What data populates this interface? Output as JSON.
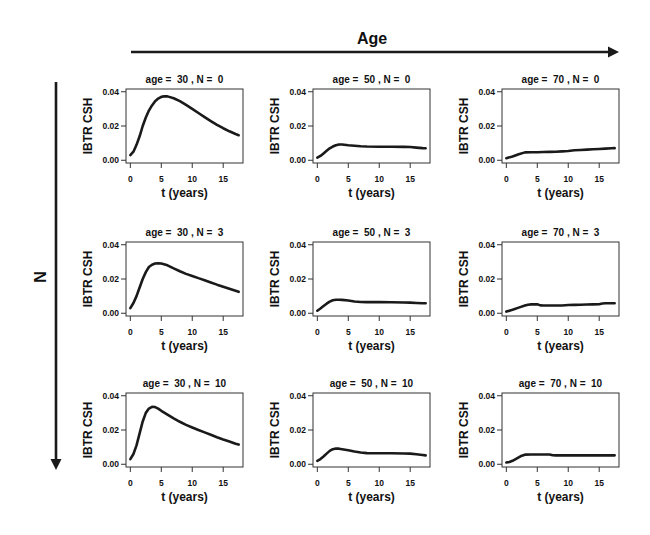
{
  "figure": {
    "column_axis_label": "Age",
    "row_axis_label": "N"
  },
  "chart_data": {
    "type": "line",
    "title": "",
    "grid_layout": {
      "rows": 3,
      "cols": 3
    },
    "column_variable": "age",
    "column_values": [
      30,
      50,
      70
    ],
    "row_variable": "N",
    "row_values": [
      0,
      3,
      10
    ],
    "xlabel": "t (years)",
    "ylabel": "IBTR CSH",
    "xlim": [
      0,
      17.5
    ],
    "ylim": [
      0,
      0.04
    ],
    "xticks": [
      0,
      5,
      10,
      15
    ],
    "xtick_labels": [
      "0",
      "5",
      "10",
      "15"
    ],
    "yticks": [
      0,
      0.02,
      0.04
    ],
    "ytick_labels": [
      "0.00",
      "0.02",
      "0.04"
    ],
    "grid": false,
    "legend": null,
    "panels": [
      {
        "title": "age =  30 , N =  0",
        "age": 30,
        "N": 0,
        "x": [
          0,
          0.5,
          1,
          1.5,
          2,
          2.5,
          3,
          3.5,
          4,
          4.5,
          5,
          5.5,
          6,
          7,
          8,
          9,
          10,
          11,
          12,
          13,
          14,
          15,
          16,
          17,
          17.5
        ],
        "y": [
          0.003,
          0.005,
          0.009,
          0.014,
          0.02,
          0.025,
          0.029,
          0.032,
          0.0345,
          0.036,
          0.037,
          0.0374,
          0.0373,
          0.0362,
          0.0345,
          0.0323,
          0.03,
          0.0276,
          0.0252,
          0.0229,
          0.0207,
          0.0187,
          0.0169,
          0.0153,
          0.0146
        ]
      },
      {
        "title": "age =  50 , N =  0",
        "age": 50,
        "N": 0,
        "x": [
          0,
          0.5,
          1,
          1.5,
          2,
          2.5,
          3,
          3.5,
          4,
          5,
          6,
          7,
          8,
          10,
          12,
          14,
          15,
          16,
          17,
          17.5
        ],
        "y": [
          0.0015,
          0.0025,
          0.004,
          0.0055,
          0.007,
          0.008,
          0.0088,
          0.0092,
          0.0092,
          0.0088,
          0.0085,
          0.0082,
          0.008,
          0.0079,
          0.0079,
          0.0078,
          0.0077,
          0.0074,
          0.0071,
          0.007
        ]
      },
      {
        "title": "age =  70 , N =  0",
        "age": 70,
        "N": 0,
        "x": [
          0,
          1,
          2,
          3,
          4,
          5,
          6,
          7,
          8,
          9,
          10,
          11,
          12,
          13,
          14,
          15,
          16,
          17,
          17.5
        ],
        "y": [
          0.0012,
          0.0022,
          0.0035,
          0.0046,
          0.0047,
          0.0047,
          0.0048,
          0.0049,
          0.005,
          0.0052,
          0.0054,
          0.0058,
          0.006,
          0.0062,
          0.0064,
          0.0066,
          0.0068,
          0.007,
          0.0071
        ]
      },
      {
        "title": "age =  30 , N =  3",
        "age": 30,
        "N": 3,
        "x": [
          0,
          0.5,
          1,
          1.5,
          2,
          2.5,
          3,
          3.5,
          4,
          4.5,
          5,
          6,
          7,
          8,
          9,
          10,
          11,
          12,
          13,
          14,
          15,
          16,
          17,
          17.5
        ],
        "y": [
          0.003,
          0.006,
          0.01,
          0.015,
          0.02,
          0.024,
          0.027,
          0.0283,
          0.029,
          0.0292,
          0.029,
          0.028,
          0.0262,
          0.0245,
          0.023,
          0.0218,
          0.0205,
          0.0193,
          0.018,
          0.0167,
          0.0155,
          0.0143,
          0.0131,
          0.0125
        ]
      },
      {
        "title": "age =  50 , N =  3",
        "age": 50,
        "N": 3,
        "x": [
          0,
          0.5,
          1,
          1.5,
          2,
          2.5,
          3,
          3.5,
          4,
          5,
          6,
          7,
          8,
          10,
          12,
          14,
          15,
          16,
          17,
          17.5
        ],
        "y": [
          0.0015,
          0.0028,
          0.0042,
          0.0056,
          0.0068,
          0.0076,
          0.0079,
          0.0079,
          0.0078,
          0.0074,
          0.0069,
          0.0066,
          0.0065,
          0.0065,
          0.0064,
          0.0063,
          0.0062,
          0.006,
          0.0058,
          0.0058
        ]
      },
      {
        "title": "age =  70 , N =  3",
        "age": 70,
        "N": 3,
        "x": [
          0,
          1,
          2,
          3,
          3.5,
          4,
          5,
          5.5,
          6,
          7,
          8,
          9,
          10,
          11,
          12,
          13,
          14,
          15,
          15.5,
          16,
          17,
          17.5
        ],
        "y": [
          0.001,
          0.002,
          0.0033,
          0.0045,
          0.005,
          0.0052,
          0.0052,
          0.0046,
          0.0045,
          0.0045,
          0.0045,
          0.0045,
          0.0048,
          0.0049,
          0.005,
          0.0051,
          0.0052,
          0.0053,
          0.0057,
          0.0058,
          0.0058,
          0.0058
        ]
      },
      {
        "title": "age =  30 , N =  10",
        "age": 30,
        "N": 10,
        "x": [
          0,
          0.5,
          1,
          1.5,
          2,
          2.5,
          3,
          3.5,
          4,
          4.5,
          5,
          6,
          7,
          8,
          9,
          10,
          11,
          12,
          13,
          14,
          15,
          16,
          17,
          17.5
        ],
        "y": [
          0.003,
          0.006,
          0.011,
          0.018,
          0.025,
          0.03,
          0.0325,
          0.0335,
          0.0334,
          0.0325,
          0.0312,
          0.029,
          0.0268,
          0.0248,
          0.023,
          0.0215,
          0.02,
          0.0186,
          0.0172,
          0.0158,
          0.0145,
          0.0133,
          0.012,
          0.0115
        ]
      },
      {
        "title": "age =  50 , N =  10",
        "age": 50,
        "N": 10,
        "x": [
          0,
          0.5,
          1,
          1.5,
          2,
          2.5,
          3,
          3.5,
          4,
          5,
          6,
          7,
          8,
          10,
          12,
          14,
          15,
          16,
          17,
          17.5
        ],
        "y": [
          0.002,
          0.003,
          0.0045,
          0.0062,
          0.0078,
          0.0088,
          0.0092,
          0.0091,
          0.0088,
          0.0082,
          0.0075,
          0.0069,
          0.0065,
          0.0064,
          0.0064,
          0.0063,
          0.0062,
          0.0058,
          0.0054,
          0.0052
        ]
      },
      {
        "title": "age =  70 , N =  10",
        "age": 70,
        "N": 10,
        "x": [
          0,
          0.5,
          1,
          1.5,
          2,
          2.5,
          3,
          4,
          5,
          6,
          7,
          7.5,
          8,
          10,
          12,
          14,
          16,
          17.5
        ],
        "y": [
          0.001,
          0.0013,
          0.002,
          0.003,
          0.004,
          0.005,
          0.0056,
          0.0057,
          0.0057,
          0.0057,
          0.0057,
          0.0053,
          0.0052,
          0.0052,
          0.0052,
          0.0052,
          0.0052,
          0.0052
        ]
      }
    ]
  }
}
